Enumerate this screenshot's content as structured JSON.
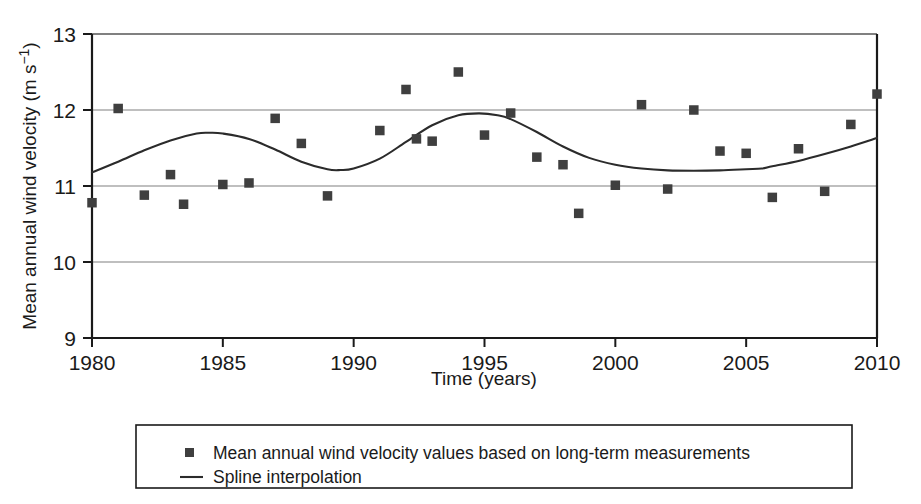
{
  "chart_data": {
    "type": "scatter",
    "title": "",
    "xlabel": "Time (years)",
    "ylabel": "Mean annual wind velocity (m s⁻¹)",
    "ylabel_base": "Mean annual wind velocity (m s",
    "ylabel_exp": "−1",
    "ylabel_tail": ")",
    "xlim": [
      1980,
      2010
    ],
    "ylim": [
      9,
      13
    ],
    "grid": true,
    "grid_axis": "y",
    "xticks": [
      1980,
      1985,
      1990,
      1995,
      2000,
      2005,
      2010
    ],
    "xtick_labels": [
      "1980",
      "1985",
      "1990",
      "1995",
      "2000",
      "2005",
      "2010"
    ],
    "yticks": [
      9,
      10,
      11,
      12,
      13
    ],
    "ytick_labels": [
      "9",
      "10",
      "11",
      "12",
      "13"
    ],
    "legend_position": "below-plot",
    "series": [
      {
        "name": "Mean annual wind velocity values based on long-term measurements",
        "type": "scatter",
        "marker": "square",
        "color": "#3f3f3f",
        "x": [
          1980,
          1981,
          1982,
          1983,
          1983.5,
          1985,
          1986,
          1987,
          1988,
          1989,
          1991,
          1992,
          1992.4,
          1993,
          1994,
          1995,
          1996,
          1997,
          1998,
          1998.6,
          2000,
          2001,
          2002,
          2003,
          2004,
          2005,
          2006,
          2007,
          2008,
          2009,
          2010
        ],
        "y": [
          10.78,
          12.02,
          10.88,
          11.15,
          10.76,
          11.02,
          11.04,
          11.89,
          11.56,
          10.87,
          11.73,
          12.27,
          11.62,
          11.59,
          12.5,
          11.67,
          11.96,
          11.38,
          11.28,
          10.64,
          11.01,
          12.07,
          10.96,
          12.0,
          11.46,
          11.43,
          10.85,
          11.49,
          10.93,
          11.81,
          12.21
        ]
      },
      {
        "name": "Spline interpolation",
        "type": "line",
        "color": "#2b2b2b",
        "x": [
          1980,
          1981,
          1982,
          1983,
          1984,
          1984.5,
          1985,
          1986,
          1987,
          1988,
          1989,
          1989.5,
          1990,
          1991,
          1992,
          1993,
          1994,
          1994.8,
          1995.5,
          1996,
          1997,
          1998,
          1999,
          2000,
          2001,
          2002,
          2003,
          2004,
          2005,
          2005.6,
          2006,
          2007,
          2008,
          2009,
          2010
        ],
        "y": [
          11.18,
          11.32,
          11.47,
          11.6,
          11.69,
          11.7,
          11.69,
          11.62,
          11.48,
          11.32,
          11.22,
          11.21,
          11.23,
          11.36,
          11.58,
          11.8,
          11.93,
          11.955,
          11.93,
          11.88,
          11.71,
          11.52,
          11.37,
          11.28,
          11.23,
          11.205,
          11.2,
          11.205,
          11.22,
          11.23,
          11.26,
          11.33,
          11.42,
          11.52,
          11.63
        ]
      }
    ]
  },
  "legend": {
    "items": [
      {
        "marker": "square-marker",
        "label": "Mean annual wind velocity values based on long-term measurements"
      },
      {
        "marker": "line-marker",
        "label": "Spline interpolation"
      }
    ]
  },
  "colors": {
    "marker": "#3f3f3f",
    "line": "#2b2b2b",
    "axis": "#1a1a1a",
    "grid": "#808080",
    "background": "#ffffff"
  }
}
